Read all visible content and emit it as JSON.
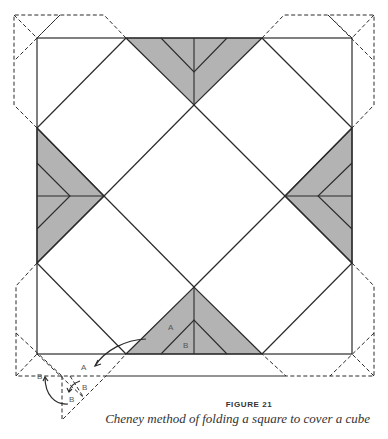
{
  "figure": {
    "label": "FIGURE 21",
    "caption": "Cheney method of folding a square to cover a cube",
    "shade_color": "#b3b3b3",
    "line_color": "#2b2b2b",
    "fold_labels": {
      "a_triangle": "A",
      "b_triangle": "B",
      "a_arrow_target": "A",
      "b_fold_1": "B",
      "b_fold_2": "B",
      "b_fold_3": "B"
    }
  }
}
